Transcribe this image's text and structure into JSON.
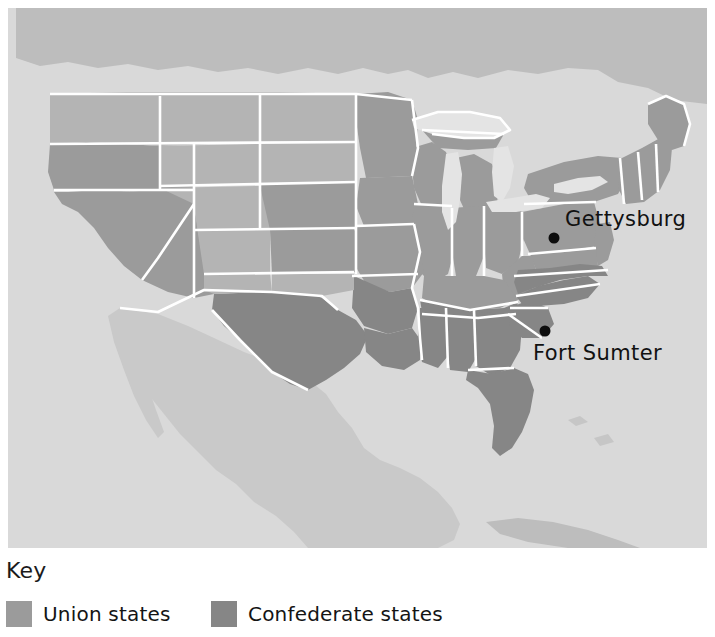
{
  "figure": {
    "type": "thematic-map",
    "alt": "Map of the United States showing Union states, Confederate states and the locations of Gettysburg and Fort Sumter"
  },
  "map": {
    "background_color": "#d8d8d8",
    "ocean_color": "#dcdcdc",
    "land_neutral_color": "#d0d0d0",
    "union_color": "#9b9b9b",
    "confederate_color": "#868686",
    "territory_color": "#b4b4b4",
    "border_color": "#ffffff",
    "lake_color": "#e4e4e4",
    "labels": [
      {
        "id": "gettysburg",
        "name": "Gettysburg",
        "text_x": 557,
        "text_y": 218,
        "dot_x": 546,
        "dot_y": 230,
        "dot_r": 5.5
      },
      {
        "id": "fort-sumter",
        "name": "Fort Sumter",
        "text_x": 525,
        "text_y": 352,
        "dot_x": 537,
        "dot_y": 323,
        "dot_r": 5.5
      }
    ]
  },
  "key": {
    "title": "Key",
    "entries": [
      {
        "id": "union",
        "label": "Union states",
        "color": "#9b9b9b"
      },
      {
        "id": "confederate",
        "label": "Confederate states",
        "color": "#868686"
      }
    ]
  }
}
